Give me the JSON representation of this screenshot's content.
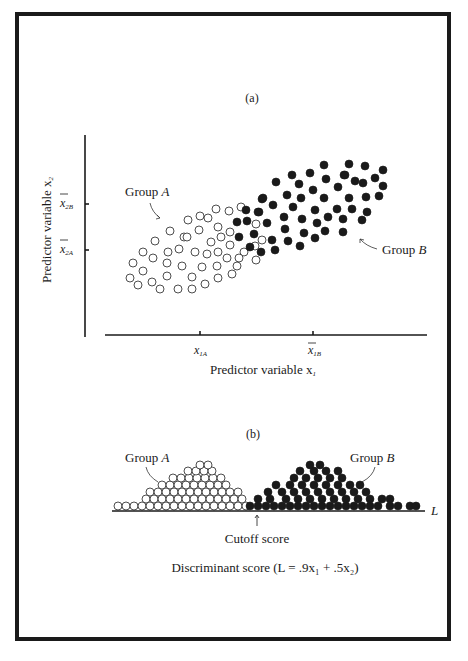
{
  "figure": {
    "panel_a": {
      "label": "(a)",
      "y_axis_label": "Predictor variable x",
      "y_axis_sub": "2",
      "x_axis_label": "Predictor variable x",
      "x_axis_sub": "1",
      "y_ticks": [
        {
          "main": "x",
          "sub": "2B",
          "bar": true
        },
        {
          "main": "x",
          "sub": "2A",
          "bar": true
        }
      ],
      "x_ticks": [
        {
          "main": "x",
          "sub": "1A",
          "bar": false
        },
        {
          "main": "x",
          "sub": "1B",
          "bar": true
        }
      ],
      "group_a_label": "Group ",
      "group_a_letter": "A",
      "group_b_label": "Group ",
      "group_b_letter": "B"
    },
    "panel_b": {
      "label": "(b)",
      "group_a_label": "Group ",
      "group_a_letter": "A",
      "group_b_label": "Group ",
      "group_b_letter": "B",
      "axis_end_label": "L",
      "cutoff_label": "Cutoff score",
      "caption": "Discriminant score (L = .9x₁ + .5x₂)"
    },
    "colors": {
      "ink": "#1a1a1a",
      "background": "#ffffff"
    }
  },
  "points": {
    "a_open": [
      [
        170,
        231
      ],
      [
        155,
        241
      ],
      [
        184,
        237
      ],
      [
        143,
        252
      ],
      [
        153,
        258
      ],
      [
        168,
        252
      ],
      [
        179,
        249
      ],
      [
        133,
        263
      ],
      [
        143,
        271
      ],
      [
        167,
        263
      ],
      [
        182,
        266
      ],
      [
        130,
        278
      ],
      [
        138,
        285
      ],
      [
        152,
        282
      ],
      [
        167,
        276
      ],
      [
        160,
        289
      ],
      [
        178,
        289
      ],
      [
        216,
        209
      ],
      [
        229,
        211
      ],
      [
        241,
        207
      ],
      [
        200,
        216
      ],
      [
        208,
        218
      ],
      [
        188,
        220
      ],
      [
        218,
        227
      ],
      [
        199,
        230
      ],
      [
        256,
        224
      ],
      [
        230,
        232
      ],
      [
        221,
        237
      ],
      [
        211,
        242
      ],
      [
        187,
        237
      ],
      [
        230,
        245
      ],
      [
        195,
        252
      ],
      [
        207,
        254
      ],
      [
        218,
        252
      ],
      [
        227,
        258
      ],
      [
        244,
        252
      ],
      [
        239,
        258
      ],
      [
        202,
        267
      ],
      [
        217,
        266
      ],
      [
        237,
        266
      ],
      [
        256,
        260
      ],
      [
        192,
        277
      ],
      [
        218,
        278
      ],
      [
        232,
        274
      ],
      [
        205,
        284
      ],
      [
        192,
        289
      ],
      [
        262,
        240
      ],
      [
        255,
        246
      ]
    ],
    "a_filled": [
      [
        246,
        210
      ],
      [
        259,
        212
      ],
      [
        262,
        199
      ],
      [
        237,
        222
      ],
      [
        247,
        221
      ],
      [
        239,
        237
      ],
      [
        254,
        234
      ],
      [
        250,
        247
      ],
      [
        261,
        252
      ],
      [
        324,
        165
      ],
      [
        349,
        164
      ],
      [
        292,
        175
      ],
      [
        310,
        173
      ],
      [
        326,
        179
      ],
      [
        344,
        175
      ],
      [
        276,
        182
      ],
      [
        299,
        184
      ],
      [
        338,
        187
      ],
      [
        313,
        190
      ],
      [
        287,
        195
      ],
      [
        301,
        198
      ],
      [
        324,
        198
      ],
      [
        349,
        198
      ],
      [
        263,
        198
      ],
      [
        273,
        205
      ],
      [
        293,
        207
      ],
      [
        315,
        210
      ],
      [
        337,
        209
      ],
      [
        352,
        209
      ],
      [
        258,
        212
      ],
      [
        284,
        217
      ],
      [
        302,
        219
      ],
      [
        328,
        217
      ],
      [
        343,
        219
      ],
      [
        317,
        223
      ],
      [
        267,
        223
      ],
      [
        285,
        229
      ],
      [
        304,
        233
      ],
      [
        325,
        231
      ],
      [
        343,
        232
      ],
      [
        272,
        240
      ],
      [
        288,
        241
      ],
      [
        315,
        238
      ],
      [
        275,
        250
      ],
      [
        300,
        246
      ],
      [
        365,
        166
      ],
      [
        383,
        170
      ],
      [
        345,
        175
      ],
      [
        375,
        178
      ],
      [
        355,
        181
      ],
      [
        363,
        183
      ],
      [
        383,
        186
      ],
      [
        366,
        197
      ],
      [
        379,
        196
      ],
      [
        367,
        212
      ],
      [
        362,
        220
      ]
    ],
    "b_open": [
      [
        118,
        506
      ],
      [
        126,
        506
      ],
      [
        134,
        506
      ],
      [
        142,
        506
      ],
      [
        150,
        506
      ],
      [
        158,
        506
      ],
      [
        166,
        506
      ],
      [
        174,
        506
      ],
      [
        182,
        506
      ],
      [
        190,
        506
      ],
      [
        198,
        506
      ],
      [
        206,
        506
      ],
      [
        214,
        506
      ],
      [
        222,
        506
      ],
      [
        230,
        506
      ],
      [
        238,
        506
      ],
      [
        246,
        506
      ],
      [
        146,
        499
      ],
      [
        154,
        499
      ],
      [
        162,
        499
      ],
      [
        170,
        499
      ],
      [
        178,
        499
      ],
      [
        186,
        499
      ],
      [
        194,
        499
      ],
      [
        202,
        499
      ],
      [
        210,
        499
      ],
      [
        218,
        499
      ],
      [
        226,
        499
      ],
      [
        234,
        499
      ],
      [
        242,
        499
      ],
      [
        150,
        492
      ],
      [
        158,
        492
      ],
      [
        166,
        492
      ],
      [
        174,
        492
      ],
      [
        182,
        492
      ],
      [
        190,
        492
      ],
      [
        198,
        492
      ],
      [
        206,
        492
      ],
      [
        214,
        492
      ],
      [
        222,
        492
      ],
      [
        230,
        492
      ],
      [
        238,
        492
      ],
      [
        162,
        485
      ],
      [
        170,
        485
      ],
      [
        178,
        485
      ],
      [
        186,
        485
      ],
      [
        194,
        485
      ],
      [
        202,
        485
      ],
      [
        210,
        485
      ],
      [
        218,
        485
      ],
      [
        226,
        485
      ],
      [
        173,
        478
      ],
      [
        181,
        478
      ],
      [
        189,
        478
      ],
      [
        197,
        478
      ],
      [
        205,
        478
      ],
      [
        213,
        478
      ],
      [
        221,
        478
      ],
      [
        188,
        471
      ],
      [
        196,
        471
      ],
      [
        204,
        471
      ],
      [
        212,
        471
      ],
      [
        200,
        465
      ],
      [
        208,
        465
      ]
    ],
    "b_filled": [
      [
        250,
        506
      ],
      [
        258,
        506
      ],
      [
        266,
        506
      ],
      [
        274,
        506
      ],
      [
        282,
        506
      ],
      [
        290,
        506
      ],
      [
        298,
        506
      ],
      [
        306,
        506
      ],
      [
        314,
        506
      ],
      [
        322,
        506
      ],
      [
        330,
        506
      ],
      [
        338,
        506
      ],
      [
        346,
        506
      ],
      [
        354,
        506
      ],
      [
        362,
        506
      ],
      [
        370,
        506
      ],
      [
        378,
        506
      ],
      [
        390,
        506
      ],
      [
        398,
        506
      ],
      [
        410,
        506
      ],
      [
        416,
        506
      ],
      [
        258,
        499
      ],
      [
        270,
        499
      ],
      [
        286,
        499
      ],
      [
        298,
        499
      ],
      [
        310,
        499
      ],
      [
        322,
        499
      ],
      [
        334,
        499
      ],
      [
        346,
        499
      ],
      [
        358,
        499
      ],
      [
        370,
        499
      ],
      [
        382,
        499
      ],
      [
        390,
        499
      ],
      [
        268,
        492
      ],
      [
        282,
        492
      ],
      [
        294,
        492
      ],
      [
        306,
        492
      ],
      [
        318,
        492
      ],
      [
        330,
        492
      ],
      [
        342,
        492
      ],
      [
        354,
        492
      ],
      [
        366,
        492
      ],
      [
        276,
        485
      ],
      [
        290,
        485
      ],
      [
        302,
        485
      ],
      [
        314,
        485
      ],
      [
        326,
        485
      ],
      [
        338,
        485
      ],
      [
        350,
        485
      ],
      [
        360,
        485
      ],
      [
        294,
        478
      ],
      [
        306,
        478
      ],
      [
        318,
        478
      ],
      [
        330,
        478
      ],
      [
        342,
        478
      ],
      [
        300,
        471
      ],
      [
        314,
        471
      ],
      [
        326,
        471
      ],
      [
        338,
        471
      ],
      [
        310,
        465
      ],
      [
        320,
        465
      ]
    ]
  }
}
